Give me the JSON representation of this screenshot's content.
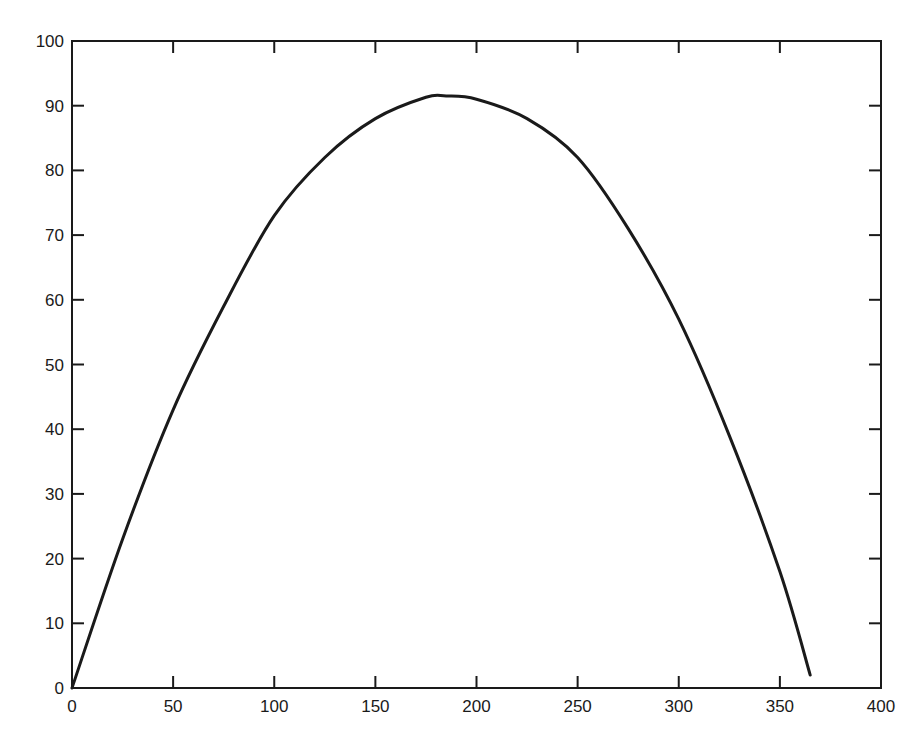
{
  "chart_data": {
    "type": "line",
    "title": "",
    "xlabel": "",
    "ylabel": "",
    "xlim": [
      0,
      400
    ],
    "ylim": [
      0,
      100
    ],
    "grid": false,
    "legend": null,
    "x_ticks": [
      0,
      50,
      100,
      150,
      200,
      250,
      300,
      350,
      400
    ],
    "y_ticks": [
      0,
      10,
      20,
      30,
      40,
      50,
      60,
      70,
      80,
      90,
      100
    ],
    "series": [
      {
        "name": "trajectory",
        "color": "#1a1a1a",
        "x": [
          0,
          25,
          50,
          75,
          100,
          125,
          150,
          175,
          185,
          200,
          225,
          250,
          275,
          300,
          325,
          350,
          365
        ],
        "y": [
          0,
          23,
          43,
          59,
          73,
          82,
          88,
          91.3,
          91.5,
          91,
          88,
          82,
          71,
          57,
          39,
          18,
          2
        ]
      }
    ]
  },
  "plot_area": {
    "left": 72,
    "top": 41,
    "right": 881,
    "bottom": 688
  },
  "colors": {
    "axis": "#1a1a1a",
    "line": "#1a1a1a",
    "background": "#ffffff"
  }
}
